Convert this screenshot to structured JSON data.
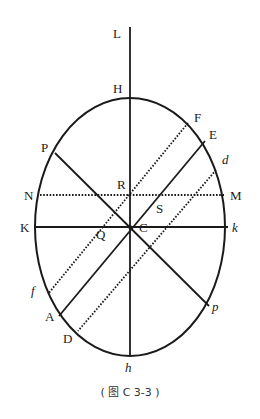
{
  "figure": {
    "caption": "( 图 C 3-3 )",
    "colors": {
      "stroke": "#1a1a1a",
      "background": "#ffffff"
    },
    "ellipse": {
      "cx": 130,
      "cy": 227,
      "rx": 95,
      "ry": 129
    },
    "labels": {
      "L": "L",
      "H": "H",
      "F": "F",
      "E": "E",
      "d": "d",
      "P": "P",
      "N": "N",
      "R": "R",
      "M": "M",
      "S": "S",
      "K": "K",
      "Q": "Q",
      "C": "C",
      "k": "k",
      "f": "f",
      "A": "A",
      "D": "D",
      "p": "p",
      "h": "h"
    },
    "solid_lines": [
      {
        "name": "axis-LH-h",
        "from": "L",
        "to": "h"
      },
      {
        "name": "diameter-Kk",
        "from": "K",
        "to": "k"
      },
      {
        "name": "diameter-Pp",
        "from": "P",
        "to": "p"
      },
      {
        "name": "diameter-EA",
        "from": "E",
        "to": "A"
      }
    ],
    "dotted_lines": [
      {
        "name": "chord-NM",
        "from": "N",
        "to": "M"
      },
      {
        "name": "chord-Ff",
        "from": "F",
        "to": "f"
      },
      {
        "name": "chord-dD",
        "from": "d",
        "to": "D"
      }
    ]
  }
}
